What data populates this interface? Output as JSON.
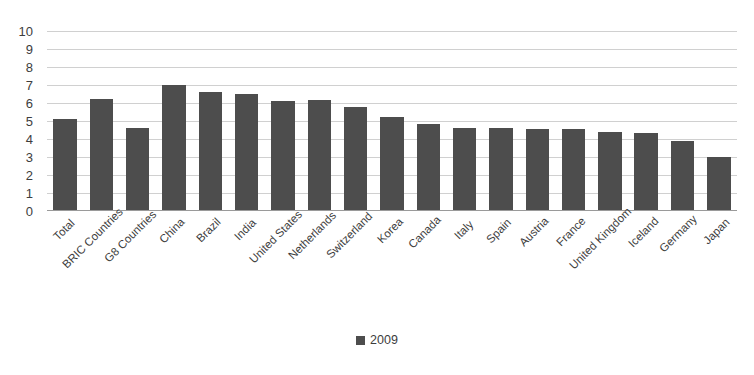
{
  "chart_data": {
    "type": "bar",
    "title": "",
    "subtitle": "",
    "xlabel": "",
    "ylabel": "",
    "ylim": [
      0,
      10
    ],
    "yticks": [
      0,
      1,
      2,
      3,
      4,
      5,
      6,
      7,
      8,
      9,
      10
    ],
    "grid": true,
    "legend_position": "bottom",
    "series": [
      {
        "name": "2009",
        "color": "#4d4d4d",
        "values": [
          5.1,
          6.2,
          4.6,
          7.0,
          6.6,
          6.5,
          6.1,
          6.15,
          5.8,
          5.2,
          4.85,
          4.6,
          4.6,
          4.55,
          4.55,
          4.4,
          4.35,
          3.9,
          3.0
        ]
      }
    ],
    "categories": [
      "Total",
      "BRIC Countries",
      "G8 Countries",
      "China",
      "Brazil",
      "India",
      "United States",
      "Netherlands",
      "Switzerland",
      "Korea",
      "Canada",
      "Italy",
      "Spain",
      "Austria",
      "France",
      "United Kingdom",
      "Iceland",
      "Germany",
      "Japan"
    ]
  },
  "legend": {
    "items": [
      {
        "label": "2009",
        "color": "#4d4d4d"
      }
    ]
  },
  "colors": {
    "bar": "#4d4d4d",
    "gridline": "#d0d0d0",
    "axis": "#9a9a9a",
    "text": "#3d3d3d",
    "background": "#ffffff"
  }
}
